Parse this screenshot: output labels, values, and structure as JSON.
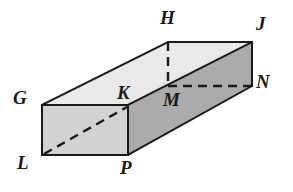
{
  "figure": {
    "shape_type": "rectangular-prism",
    "projection": "oblique",
    "canvas": {
      "width": 293,
      "height": 192
    },
    "colors": {
      "background": "#ffffff",
      "top_face": "#e9e9e9",
      "left_face": "#d2d2d2",
      "front_face": "#ababab",
      "far_end_face": "#b4b4b4",
      "outline": "#1a1a1a",
      "hidden_edge": "#1a1a1a",
      "label_text": "#1a1a1a"
    },
    "stroke": {
      "outline_width": 2,
      "hidden_width": 2.4,
      "hidden_dash": "9 6"
    },
    "vertices": [
      {
        "id": "G",
        "label": "G",
        "x": 42,
        "y": 105,
        "label_x": 13,
        "label_y": 88,
        "hidden": false
      },
      {
        "id": "H",
        "label": "H",
        "x": 168,
        "y": 42,
        "label_x": 160,
        "label_y": 8,
        "hidden": false
      },
      {
        "id": "J",
        "label": "J",
        "x": 252,
        "y": 42,
        "label_x": 256,
        "label_y": 14,
        "hidden": false
      },
      {
        "id": "K",
        "label": "K",
        "x": 128,
        "y": 105,
        "label_x": 117,
        "label_y": 83,
        "hidden": false
      },
      {
        "id": "L",
        "label": "L",
        "x": 42,
        "y": 155,
        "label_x": 17,
        "label_y": 153,
        "hidden": false
      },
      {
        "id": "M",
        "label": "M",
        "x": 168,
        "y": 86,
        "label_x": 163,
        "label_y": 90,
        "hidden": true
      },
      {
        "id": "N",
        "label": "N",
        "x": 252,
        "y": 86,
        "label_x": 256,
        "label_y": 72,
        "hidden": true
      },
      {
        "id": "P",
        "label": "P",
        "x": 128,
        "y": 155,
        "label_x": 120,
        "label_y": 158,
        "hidden": false
      }
    ],
    "faces": [
      {
        "id": "top-face",
        "name": "top-face-GHJK",
        "vertices": "G,H,J,K",
        "points": "42,105 168,42 252,42 128,105",
        "fill": "#e9e9e9"
      },
      {
        "id": "left-face",
        "name": "left-face-GKPL",
        "vertices": "G,K,P,L",
        "points": "42,105 128,105 128,155 42,155",
        "fill": "#d2d2d2"
      },
      {
        "id": "front-face",
        "name": "front-face-KJNP",
        "vertices": "K,J,N,P",
        "points": "128,105 252,42 252,86 128,155",
        "fill": "#ababab"
      }
    ],
    "visible_edges": [
      {
        "name": "edge-G-H",
        "from": "G",
        "to": "H",
        "x1": 42,
        "y1": 105,
        "x2": 168,
        "y2": 42
      },
      {
        "name": "edge-H-J",
        "from": "H",
        "to": "J",
        "x1": 168,
        "y1": 42,
        "x2": 252,
        "y2": 42
      },
      {
        "name": "edge-G-K",
        "from": "G",
        "to": "K",
        "x1": 42,
        "y1": 105,
        "x2": 128,
        "y2": 105
      },
      {
        "name": "edge-K-J",
        "from": "K",
        "to": "J",
        "x1": 128,
        "y1": 105,
        "x2": 252,
        "y2": 42
      },
      {
        "name": "edge-J-N",
        "from": "J",
        "to": "N",
        "x1": 252,
        "y1": 42,
        "x2": 252,
        "y2": 86
      },
      {
        "name": "edge-N-P",
        "from": "N",
        "to": "P",
        "x1": 252,
        "y1": 86,
        "x2": 128,
        "y2": 155
      },
      {
        "name": "edge-G-L",
        "from": "G",
        "to": "L",
        "x1": 42,
        "y1": 105,
        "x2": 42,
        "y2": 155
      },
      {
        "name": "edge-K-P",
        "from": "K",
        "to": "P",
        "x1": 128,
        "y1": 105,
        "x2": 128,
        "y2": 155
      },
      {
        "name": "edge-L-P",
        "from": "L",
        "to": "P",
        "x1": 42,
        "y1": 155,
        "x2": 128,
        "y2": 155
      }
    ],
    "hidden_edges": [
      {
        "name": "hidden-edge-H-M",
        "from": "H",
        "to": "M",
        "x1": 168,
        "y1": 42,
        "x2": 168,
        "y2": 86
      },
      {
        "name": "hidden-edge-M-N",
        "from": "M",
        "to": "N",
        "x1": 168,
        "y1": 86,
        "x2": 252,
        "y2": 86
      },
      {
        "name": "hidden-edge-L-K",
        "from": "L",
        "to": "K",
        "x1": 44,
        "y1": 154,
        "x2": 127,
        "y2": 107
      }
    ]
  }
}
